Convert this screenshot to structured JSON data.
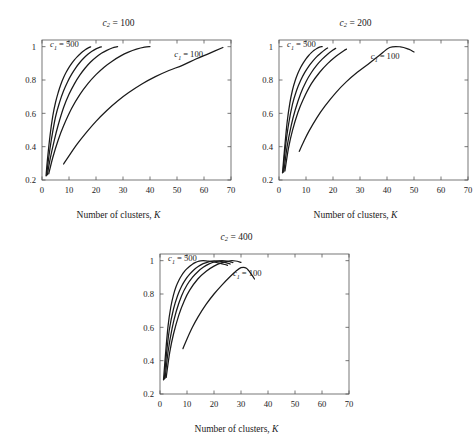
{
  "figure": {
    "background": "#ffffff",
    "line_color": "#1a1a1a",
    "axis_color": "#555555"
  },
  "common": {
    "xlabel_prefix": "Number of clusters,",
    "xlabel_symbol": "K",
    "xticks": [
      "0",
      "10",
      "20",
      "30",
      "40",
      "50",
      "60",
      "70"
    ],
    "yticks": [
      "0.2",
      "0.4",
      "0.6",
      "0.8",
      "1"
    ],
    "xlim": [
      0,
      70
    ],
    "ylim": [
      0.2,
      1.04
    ],
    "label_c1_500_prefix": "c",
    "label_c1_500_sub": "1",
    "label_c1_500_value": "= 500",
    "label_c1_100_prefix": "c",
    "label_c1_100_sub": "1",
    "label_c1_100_value": "= 100",
    "title_prefix": "c",
    "title_sub": "2"
  },
  "panels": [
    {
      "id": "panel-c2-100",
      "title_value": "= 100",
      "title_full": "c2 = 100",
      "c2": 100
    },
    {
      "id": "panel-c2-200",
      "title_value": "= 200",
      "title_full": "c2 = 200",
      "c2": 200
    },
    {
      "id": "panel-c2-400",
      "title_value": "= 400",
      "title_full": "c2 = 400",
      "c2": 400
    }
  ],
  "chart_data": [
    {
      "type": "line",
      "title": "c2 = 100",
      "xlabel": "Number of clusters, K",
      "ylabel": "",
      "xlim": [
        0,
        70
      ],
      "ylim": [
        0.2,
        1.04
      ],
      "xticks": [
        0,
        10,
        20,
        30,
        40,
        50,
        60,
        70
      ],
      "yticks": [
        0.2,
        0.4,
        0.6,
        0.8,
        1.0
      ],
      "grid": false,
      "legend": "inline-annotations",
      "annotations": [
        {
          "text": "c1 = 500",
          "x": 3,
          "y": 1.02
        },
        {
          "text": "c1 = 100",
          "x": 49,
          "y": 0.955
        }
      ],
      "series": [
        {
          "name": "c1 = 500",
          "x": [
            1.5,
            2,
            3,
            4,
            5,
            6,
            7,
            8,
            9,
            10,
            11,
            12,
            13,
            14,
            15,
            16,
            17,
            18
          ],
          "y": [
            0.225,
            0.32,
            0.47,
            0.585,
            0.665,
            0.725,
            0.775,
            0.815,
            0.848,
            0.876,
            0.9,
            0.921,
            0.939,
            0.955,
            0.969,
            0.981,
            0.991,
            0.999
          ]
        },
        {
          "name": "c1 = 400",
          "x": [
            1.7,
            2.5,
            3.5,
            5,
            6.5,
            8,
            9.5,
            11,
            12.5,
            14,
            15.5,
            17,
            18.5,
            20,
            21.5,
            22
          ],
          "y": [
            0.228,
            0.335,
            0.445,
            0.578,
            0.666,
            0.735,
            0.79,
            0.835,
            0.873,
            0.905,
            0.932,
            0.954,
            0.973,
            0.987,
            0.997,
            0.999
          ]
        },
        {
          "name": "c1 = 300",
          "x": [
            2,
            3,
            4.5,
            6,
            8,
            10,
            12,
            14,
            16,
            18,
            20,
            22,
            24,
            26,
            28
          ],
          "y": [
            0.232,
            0.325,
            0.435,
            0.53,
            0.635,
            0.714,
            0.777,
            0.829,
            0.872,
            0.908,
            0.937,
            0.96,
            0.978,
            0.992,
            1.0
          ]
        },
        {
          "name": "c1 = 200",
          "x": [
            2.5,
            4,
            6,
            8,
            11,
            14,
            17,
            20,
            23,
            26,
            29,
            32,
            35,
            38,
            40
          ],
          "y": [
            0.237,
            0.335,
            0.44,
            0.525,
            0.63,
            0.712,
            0.778,
            0.832,
            0.877,
            0.913,
            0.943,
            0.967,
            0.985,
            0.997,
            1.0
          ]
        },
        {
          "name": "c1 = 100",
          "x": [
            8,
            10,
            13,
            16,
            20,
            24,
            28,
            32,
            37,
            42,
            47,
            52,
            57,
            62,
            67
          ],
          "y": [
            0.296,
            0.345,
            0.415,
            0.477,
            0.552,
            0.617,
            0.674,
            0.723,
            0.776,
            0.82,
            0.857,
            0.888,
            0.926,
            0.96,
            0.995
          ]
        }
      ]
    },
    {
      "type": "line",
      "title": "c2 = 200",
      "xlabel": "Number of clusters, K",
      "ylabel": "",
      "xlim": [
        0,
        70
      ],
      "ylim": [
        0.2,
        1.04
      ],
      "xticks": [
        0,
        10,
        20,
        30,
        40,
        50,
        60,
        70
      ],
      "yticks": [
        0.2,
        0.4,
        0.6,
        0.8,
        1.0
      ],
      "grid": false,
      "legend": "inline-annotations",
      "annotations": [
        {
          "text": "c1 = 500",
          "x": 3,
          "y": 1.02
        },
        {
          "text": "c1 = 100",
          "x": 34,
          "y": 0.945
        }
      ],
      "series": [
        {
          "name": "c1 = 500",
          "x": [
            1.3,
            2,
            3,
            4,
            5,
            6,
            7,
            8,
            9,
            10,
            11,
            12,
            13,
            14,
            15,
            16
          ],
          "y": [
            0.243,
            0.375,
            0.545,
            0.66,
            0.74,
            0.797,
            0.84,
            0.875,
            0.903,
            0.927,
            0.947,
            0.964,
            0.978,
            0.989,
            0.997,
            1.0
          ]
        },
        {
          "name": "c1 = 400",
          "x": [
            1.5,
            2.3,
            3.5,
            5,
            6.5,
            8,
            9.5,
            11,
            12.5,
            14,
            15.5,
            17,
            18
          ],
          "y": [
            0.246,
            0.385,
            0.53,
            0.655,
            0.737,
            0.797,
            0.844,
            0.882,
            0.913,
            0.94,
            0.962,
            0.982,
            0.992
          ]
        },
        {
          "name": "c1 = 300",
          "x": [
            1.8,
            3,
            4.5,
            6,
            8,
            10,
            12,
            14,
            16,
            18,
            20,
            21
          ],
          "y": [
            0.25,
            0.4,
            0.525,
            0.62,
            0.718,
            0.79,
            0.845,
            0.889,
            0.925,
            0.955,
            0.98,
            0.99
          ]
        },
        {
          "name": "c1 = 200",
          "x": [
            2.2,
            3.5,
            5,
            7,
            9,
            12,
            15,
            18,
            21,
            24,
            25
          ],
          "y": [
            0.255,
            0.39,
            0.498,
            0.605,
            0.685,
            0.778,
            0.845,
            0.898,
            0.941,
            0.976,
            0.985
          ]
        },
        {
          "name": "c1 = 100",
          "x": [
            7.5,
            9,
            11,
            14,
            17,
            21,
            25,
            29,
            33,
            37,
            41,
            45,
            48,
            50
          ],
          "y": [
            0.372,
            0.425,
            0.49,
            0.573,
            0.643,
            0.723,
            0.79,
            0.846,
            0.895,
            0.945,
            0.995,
            0.999,
            0.985,
            0.968
          ]
        }
      ]
    },
    {
      "type": "line",
      "title": "c2 = 400",
      "xlabel": "Number of clusters, K",
      "ylabel": "",
      "xlim": [
        0,
        70
      ],
      "ylim": [
        0.2,
        1.04
      ],
      "xticks": [
        0,
        10,
        20,
        30,
        40,
        50,
        60,
        70
      ],
      "yticks": [
        0.2,
        0.4,
        0.6,
        0.8,
        1.0
      ],
      "grid": false,
      "legend": "inline-annotations",
      "annotations": [
        {
          "text": "c1 = 500",
          "x": 3,
          "y": 1.02
        },
        {
          "text": "c1 = 100",
          "x": 27,
          "y": 0.925
        }
      ],
      "series": [
        {
          "name": "c1 = 500",
          "x": [
            1.3,
            2,
            3,
            4,
            5,
            6,
            7,
            8,
            9,
            10,
            11,
            12,
            13,
            14,
            15,
            16,
            17,
            18,
            20,
            22,
            24,
            25
          ],
          "y": [
            0.285,
            0.43,
            0.61,
            0.722,
            0.795,
            0.846,
            0.883,
            0.911,
            0.934,
            0.952,
            0.967,
            0.979,
            0.988,
            0.995,
            0.999,
            1.0,
            0.999,
            0.997,
            0.992,
            0.985,
            0.977,
            0.972
          ]
        },
        {
          "name": "c1 = 400",
          "x": [
            1.6,
            2.4,
            3.5,
            5,
            6.5,
            8,
            9.5,
            11,
            12.5,
            14,
            16,
            18,
            20,
            22,
            24,
            26
          ],
          "y": [
            0.29,
            0.44,
            0.59,
            0.71,
            0.79,
            0.847,
            0.888,
            0.919,
            0.944,
            0.963,
            0.982,
            0.993,
            0.999,
            0.997,
            0.99,
            0.98
          ]
        },
        {
          "name": "c1 = 300",
          "x": [
            1.9,
            3,
            4.5,
            6,
            8,
            10,
            12,
            14,
            16,
            18,
            20,
            22,
            24,
            26,
            27
          ],
          "y": [
            0.295,
            0.455,
            0.595,
            0.695,
            0.79,
            0.854,
            0.9,
            0.934,
            0.96,
            0.979,
            0.992,
            0.999,
            0.999,
            0.993,
            0.988
          ]
        },
        {
          "name": "c1 = 200",
          "x": [
            2.3,
            3.6,
            5,
            7,
            9,
            11,
            14,
            17,
            20,
            23,
            26,
            28,
            30
          ],
          "y": [
            0.3,
            0.45,
            0.56,
            0.675,
            0.76,
            0.823,
            0.89,
            0.935,
            0.967,
            0.988,
            0.999,
            0.998,
            0.99
          ]
        },
        {
          "name": "c1 = 100",
          "x": [
            8.5,
            10,
            12,
            14,
            17,
            20,
            23,
            26,
            28,
            30,
            32,
            34,
            35
          ],
          "y": [
            0.472,
            0.53,
            0.6,
            0.66,
            0.736,
            0.8,
            0.855,
            0.905,
            0.935,
            0.958,
            0.955,
            0.915,
            0.89
          ]
        }
      ]
    }
  ]
}
